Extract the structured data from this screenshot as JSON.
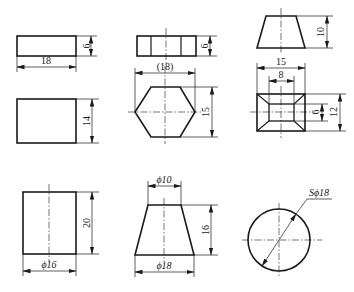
{
  "figure": {
    "colors": {
      "line": "#1a1a1a",
      "background": "#ffffff"
    },
    "views": [
      {
        "id": "prism-front",
        "shape": "rectangle",
        "dims": {
          "width": "18",
          "height": "6"
        }
      },
      {
        "id": "hex-prism-front",
        "shape": "rectangle-with-edges",
        "dims": {
          "height": "6"
        }
      },
      {
        "id": "frustum-pyramid-front",
        "shape": "trapezoid",
        "dims": {
          "height": "10"
        }
      },
      {
        "id": "prism-top",
        "shape": "rectangle",
        "dims": {
          "height": "14"
        }
      },
      {
        "id": "hex-prism-top",
        "shape": "hexagon",
        "dims": {
          "across_corners": "(18)",
          "across_flats": "15"
        }
      },
      {
        "id": "frustum-pyramid-top",
        "shape": "nested-square",
        "dims": {
          "outer_width": "15",
          "inner_width": "8",
          "inner_height": "6",
          "outer_height": "12"
        }
      },
      {
        "id": "cylinder-front",
        "shape": "rectangle",
        "dims": {
          "height": "20",
          "diameter": "ϕ16"
        }
      },
      {
        "id": "cone-frustum-front",
        "shape": "trapezoid",
        "dims": {
          "top_diameter": "ϕ10",
          "height": "16",
          "bottom_diameter": "ϕ18"
        }
      },
      {
        "id": "sphere",
        "shape": "circle",
        "dims": {
          "sphere_diameter": "Sϕ18"
        }
      }
    ]
  },
  "labels": {
    "r1_w": "18",
    "r1_h": "6",
    "r2_h": "6",
    "r3_h": "10",
    "r4_h": "14",
    "hex_w": "(18)",
    "hex_h": "15",
    "sq_w_outer": "15",
    "sq_w_inner": "8",
    "sq_h_inner": "6",
    "sq_h_outer": "12",
    "cyl_h": "20",
    "cyl_d": "ϕ16",
    "cone_top": "ϕ10",
    "cone_h": "16",
    "cone_bot": "ϕ18",
    "sphere_d": "Sϕ18"
  }
}
